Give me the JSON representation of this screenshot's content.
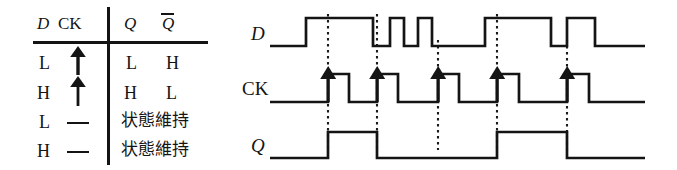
{
  "figure": {
    "background": "#ffffff",
    "ink_color": "#141414",
    "width": 677,
    "height": 170
  },
  "truth_table": {
    "headers": {
      "input_d": "D",
      "input_ck": "CK",
      "output_q": "Q",
      "output_qbar": "Q"
    },
    "rows": [
      {
        "d": "L",
        "ck": "rising-edge-arrow",
        "ck_symbol": "↑",
        "q": "L",
        "qbar": "H",
        "hold": false
      },
      {
        "d": "H",
        "ck": "rising-edge-arrow",
        "ck_symbol": "↑",
        "q": "H",
        "qbar": "L",
        "hold": false
      },
      {
        "d": "L",
        "ck": "dash",
        "ck_symbol": "—",
        "hold": true,
        "hold_text": "状態維持"
      },
      {
        "d": "H",
        "ck": "dash",
        "ck_symbol": "—",
        "hold": true,
        "hold_text": "状態維持"
      }
    ]
  },
  "timing_diagram": {
    "row_labels": {
      "d": "D",
      "ck": "CK",
      "q": "Q"
    },
    "clock_edge_count": 5,
    "clock_edge_marker": "filled-up-triangle-arrow",
    "edge_guide_style": "dotted",
    "waveforms": {
      "d": {
        "name": "D",
        "high_y": 18,
        "low_y": 46,
        "start_level": "low",
        "transitions_x": [
          306,
          373,
          390,
          404,
          418,
          432,
          485,
          551,
          567,
          595,
          624
        ],
        "description": "Data input with two narrow pulses between the second and third clock edges"
      },
      "ck": {
        "name": "CK",
        "high_y": 74,
        "low_y": 102,
        "start_level": "low",
        "rising_edges_x": [
          328,
          377,
          438,
          497,
          567
        ],
        "falling_edges_x": [
          349,
          398,
          459,
          519,
          589
        ],
        "description": "Clock with five rising edges"
      },
      "q": {
        "name": "Q",
        "high_y": 132,
        "low_y": 158,
        "start_level": "low",
        "transitions_x": [
          328,
          377,
          497,
          567
        ],
        "levels_after_edges": [
          "H",
          "L",
          "L",
          "H",
          "L"
        ],
        "description": "Output follows D on each rising clock edge"
      }
    },
    "edge_guides_x": [
      328,
      377,
      438,
      497,
      567
    ],
    "trace_start_x": 270,
    "trace_end_x": 645
  }
}
